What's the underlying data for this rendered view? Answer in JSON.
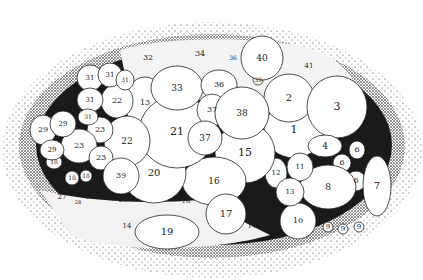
{
  "figure": {
    "colors": {
      "ink": "#111111",
      "stipple": "#333333",
      "background": "#ffffff"
    },
    "cells": [
      {
        "label": "1",
        "cx": 294,
        "cy": 130,
        "rx": 30,
        "ry": 28,
        "fs": 11
      },
      {
        "label": "2",
        "cx": 289,
        "cy": 98,
        "rx": 25,
        "ry": 24,
        "fs": 10
      },
      {
        "label": "3",
        "cx": 337,
        "cy": 107,
        "rx": 30,
        "ry": 31,
        "fs": 11
      },
      {
        "label": "4",
        "cx": 325,
        "cy": 146,
        "rx": 17,
        "ry": 11,
        "fs": 9
      },
      {
        "label": "5",
        "cx": 363,
        "cy": 130,
        "rx": 4,
        "ry": 4,
        "fs": 7,
        "noshape": true
      },
      {
        "label": "6",
        "cx": 357,
        "cy": 150,
        "rx": 8,
        "ry": 9,
        "fs": 8
      },
      {
        "label": "6",
        "cx": 342,
        "cy": 163,
        "rx": 9,
        "ry": 9,
        "fs": 8
      },
      {
        "label": "6",
        "cx": 356,
        "cy": 181,
        "rx": 10,
        "ry": 10,
        "fs": 8
      },
      {
        "label": "7",
        "cx": 377,
        "cy": 186,
        "rx": 14,
        "ry": 30,
        "fs": 10
      },
      {
        "label": "8",
        "cx": 328,
        "cy": 187,
        "rx": 28,
        "ry": 22,
        "fs": 9
      },
      {
        "label": "9",
        "cx": 328,
        "cy": 227,
        "rx": 5,
        "ry": 5,
        "fs": 7
      },
      {
        "label": "9",
        "cx": 343,
        "cy": 229,
        "rx": 5,
        "ry": 5,
        "fs": 7
      },
      {
        "label": "9",
        "cx": 359,
        "cy": 227,
        "rx": 5,
        "ry": 5,
        "fs": 7
      },
      {
        "label": "10",
        "cx": 298,
        "cy": 221,
        "rx": 18,
        "ry": 18,
        "fs": 8
      },
      {
        "label": "11",
        "cx": 300,
        "cy": 167,
        "rx": 13,
        "ry": 14,
        "fs": 7
      },
      {
        "label": "12",
        "cx": 276,
        "cy": 173,
        "rx": 11,
        "ry": 15,
        "fs": 7
      },
      {
        "label": "13",
        "cx": 290,
        "cy": 192,
        "rx": 14,
        "ry": 14,
        "fs": 7
      },
      {
        "label": "13",
        "cx": 145,
        "cy": 103,
        "rx": 20,
        "ry": 26,
        "fs": 8
      },
      {
        "label": "14",
        "cx": 252,
        "cy": 226,
        "rx": 4,
        "ry": 4,
        "fs": 7,
        "noshape": true
      },
      {
        "label": "14",
        "cx": 127,
        "cy": 226,
        "rx": 4,
        "ry": 4,
        "fs": 7,
        "noshape": true
      },
      {
        "label": "15",
        "cx": 245,
        "cy": 153,
        "rx": 30,
        "ry": 30,
        "fs": 11
      },
      {
        "label": "16",
        "cx": 214,
        "cy": 181,
        "rx": 32,
        "ry": 24,
        "fs": 9
      },
      {
        "label": "17",
        "cx": 226,
        "cy": 214,
        "rx": 20,
        "ry": 20,
        "fs": 10
      },
      {
        "label": "18",
        "cx": 186,
        "cy": 201,
        "rx": 4,
        "ry": 4,
        "fs": 7,
        "noshape": true
      },
      {
        "label": "18",
        "cx": 54,
        "cy": 162,
        "rx": 8,
        "ry": 7,
        "fs": 6
      },
      {
        "label": "18",
        "cx": 72,
        "cy": 178,
        "rx": 7,
        "ry": 7,
        "fs": 6
      },
      {
        "label": "18",
        "cx": 86,
        "cy": 176,
        "rx": 6,
        "ry": 6,
        "fs": 6
      },
      {
        "label": "19",
        "cx": 167,
        "cy": 232,
        "rx": 32,
        "ry": 17,
        "fs": 10
      },
      {
        "label": "20",
        "cx": 154,
        "cy": 173,
        "rx": 32,
        "ry": 30,
        "fs": 10
      },
      {
        "label": "21",
        "cx": 177,
        "cy": 132,
        "rx": 38,
        "ry": 36,
        "fs": 11
      },
      {
        "label": "22",
        "cx": 117,
        "cy": 101,
        "rx": 16,
        "ry": 17,
        "fs": 8
      },
      {
        "label": "22",
        "cx": 127,
        "cy": 141,
        "rx": 23,
        "ry": 25,
        "fs": 9
      },
      {
        "label": "23",
        "cx": 100,
        "cy": 130,
        "rx": 13,
        "ry": 13,
        "fs": 8
      },
      {
        "label": "23",
        "cx": 79,
        "cy": 146,
        "rx": 18,
        "ry": 17,
        "fs": 8
      },
      {
        "label": "23",
        "cx": 101,
        "cy": 158,
        "rx": 12,
        "ry": 12,
        "fs": 8
      },
      {
        "label": "26",
        "cx": 123,
        "cy": 200,
        "rx": 4,
        "ry": 4,
        "fs": 7,
        "noshape": true
      },
      {
        "label": "27",
        "cx": 62,
        "cy": 197,
        "rx": 4,
        "ry": 4,
        "fs": 7,
        "noshape": true
      },
      {
        "label": "28",
        "cx": 78,
        "cy": 203,
        "rx": 4,
        "ry": 4,
        "fs": 5,
        "noshape": true
      },
      {
        "label": "28",
        "cx": 89,
        "cy": 198,
        "rx": 4,
        "ry": 4,
        "fs": 5,
        "noshape": true
      },
      {
        "label": "29",
        "cx": 43,
        "cy": 130,
        "rx": 13,
        "ry": 15,
        "fs": 8
      },
      {
        "label": "29",
        "cx": 63,
        "cy": 124,
        "rx": 13,
        "ry": 13,
        "fs": 7
      },
      {
        "label": "29",
        "cx": 52,
        "cy": 150,
        "rx": 12,
        "ry": 10,
        "fs": 7
      },
      {
        "label": "30",
        "cx": 64,
        "cy": 103,
        "rx": 4,
        "ry": 4,
        "fs": 7,
        "noshape": true
      },
      {
        "label": "31",
        "cx": 90,
        "cy": 78,
        "rx": 13,
        "ry": 13,
        "fs": 7
      },
      {
        "label": "31",
        "cx": 110,
        "cy": 75,
        "rx": 12,
        "ry": 12,
        "fs": 7
      },
      {
        "label": "31",
        "cx": 125,
        "cy": 80,
        "rx": 9,
        "ry": 10,
        "fs": 6
      },
      {
        "label": "31",
        "cx": 90,
        "cy": 100,
        "rx": 13,
        "ry": 12,
        "fs": 7
      },
      {
        "label": "31",
        "cx": 88,
        "cy": 117,
        "rx": 10,
        "ry": 8,
        "fs": 6
      },
      {
        "label": "32",
        "cx": 148,
        "cy": 58,
        "rx": 4,
        "ry": 4,
        "fs": 8,
        "noshape": true
      },
      {
        "label": "33",
        "cx": 177,
        "cy": 88,
        "rx": 26,
        "ry": 22,
        "fs": 9
      },
      {
        "label": "34",
        "cx": 200,
        "cy": 54,
        "rx": 4,
        "ry": 4,
        "fs": 8,
        "noshape": true
      },
      {
        "label": "36",
        "cx": 219,
        "cy": 85,
        "rx": 18,
        "ry": 15,
        "fs": 8
      },
      {
        "label": "36",
        "cx": 233,
        "cy": 58,
        "rx": 4,
        "ry": 4,
        "fs": 6,
        "noshape": true
      },
      {
        "label": "37",
        "cx": 212,
        "cy": 110,
        "rx": 15,
        "ry": 16,
        "fs": 8
      },
      {
        "label": "37",
        "cx": 205,
        "cy": 138,
        "rx": 17,
        "ry": 17,
        "fs": 9
      },
      {
        "label": "38",
        "cx": 242,
        "cy": 113,
        "rx": 27,
        "ry": 26,
        "fs": 9
      },
      {
        "label": "39",
        "cx": 258,
        "cy": 80,
        "rx": 5,
        "ry": 5,
        "fs": 6
      },
      {
        "label": "39",
        "cx": 121,
        "cy": 176,
        "rx": 18,
        "ry": 18,
        "fs": 8
      },
      {
        "label": "40",
        "cx": 262,
        "cy": 58,
        "rx": 21,
        "ry": 22,
        "fs": 9
      },
      {
        "label": "41",
        "cx": 309,
        "cy": 66,
        "rx": 4,
        "ry": 4,
        "fs": 7,
        "noshape": true
      }
    ]
  }
}
